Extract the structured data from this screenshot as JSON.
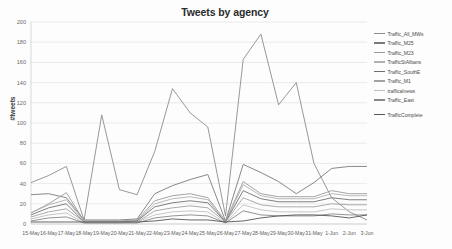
{
  "chart_data": {
    "type": "line",
    "title": "Tweets by agency",
    "xlabel": "",
    "ylabel": "#tweets",
    "ylim": [
      0,
      200
    ],
    "yticks": [
      0,
      20,
      40,
      60,
      80,
      100,
      120,
      140,
      160,
      180,
      200
    ],
    "grid": true,
    "legend_position": "right",
    "categories": [
      "15-May",
      "16-May",
      "17-May",
      "18-May",
      "19-May",
      "20-May",
      "21-May",
      "22-May",
      "23-May",
      "24-May",
      "25-May",
      "26-May",
      "27-May",
      "28-May",
      "29-May",
      "30-May",
      "31-May",
      "1-Jun",
      "2-Jun",
      "3-Jun"
    ],
    "series": [
      {
        "name": "Traffic_All_MWs",
        "color": "#8c8c8c",
        "values": [
          41,
          48,
          57,
          4,
          108,
          34,
          29,
          72,
          134,
          110,
          96,
          8,
          163,
          188,
          118,
          140,
          60,
          26,
          12,
          4
        ]
      },
      {
        "name": "Traffic_M25",
        "color": "#7a7a7a",
        "values": [
          29,
          30,
          26,
          4,
          4,
          4,
          5,
          30,
          38,
          44,
          49,
          3,
          59,
          51,
          42,
          30,
          41,
          55,
          57,
          57
        ]
      },
      {
        "name": "Traffic_M23",
        "color": "#9a9a9a",
        "values": [
          11,
          20,
          31,
          3,
          3,
          3,
          4,
          23,
          28,
          30,
          26,
          3,
          42,
          30,
          27,
          27,
          27,
          33,
          30,
          30
        ]
      },
      {
        "name": "TrafficStAlbans",
        "color": "#b0b0b0",
        "values": [
          11,
          19,
          24,
          3,
          3,
          3,
          3,
          20,
          25,
          27,
          24,
          2,
          39,
          28,
          25,
          25,
          25,
          30,
          28,
          28
        ]
      },
      {
        "name": "Traffic_SouthE",
        "color": "#707070",
        "values": [
          9,
          16,
          20,
          2,
          2,
          2,
          3,
          17,
          21,
          23,
          21,
          2,
          33,
          25,
          22,
          22,
          22,
          26,
          24,
          24
        ]
      },
      {
        "name": "Traffic_M1",
        "color": "#a2a2a2",
        "values": [
          7,
          12,
          15,
          2,
          2,
          2,
          2,
          13,
          16,
          18,
          16,
          2,
          26,
          19,
          17,
          17,
          17,
          20,
          19,
          19
        ]
      },
      {
        "name": "trafficalnews",
        "color": "#c0c0c0",
        "values": [
          5,
          9,
          11,
          1,
          1,
          1,
          2,
          9,
          12,
          13,
          12,
          1,
          19,
          14,
          12,
          12,
          12,
          15,
          14,
          14
        ]
      },
      {
        "name": "Traffic_East",
        "color": "#888888",
        "values": [
          3,
          6,
          7,
          1,
          1,
          1,
          1,
          6,
          8,
          9,
          8,
          1,
          13,
          9,
          8,
          8,
          8,
          10,
          9,
          9
        ]
      },
      {
        "name": "TrafficComplete",
        "color": "#555555",
        "values": [
          2,
          2,
          2,
          2,
          2,
          2,
          2,
          3,
          5,
          4,
          4,
          2,
          3,
          6,
          8,
          9,
          9,
          8,
          6,
          9
        ]
      }
    ]
  }
}
